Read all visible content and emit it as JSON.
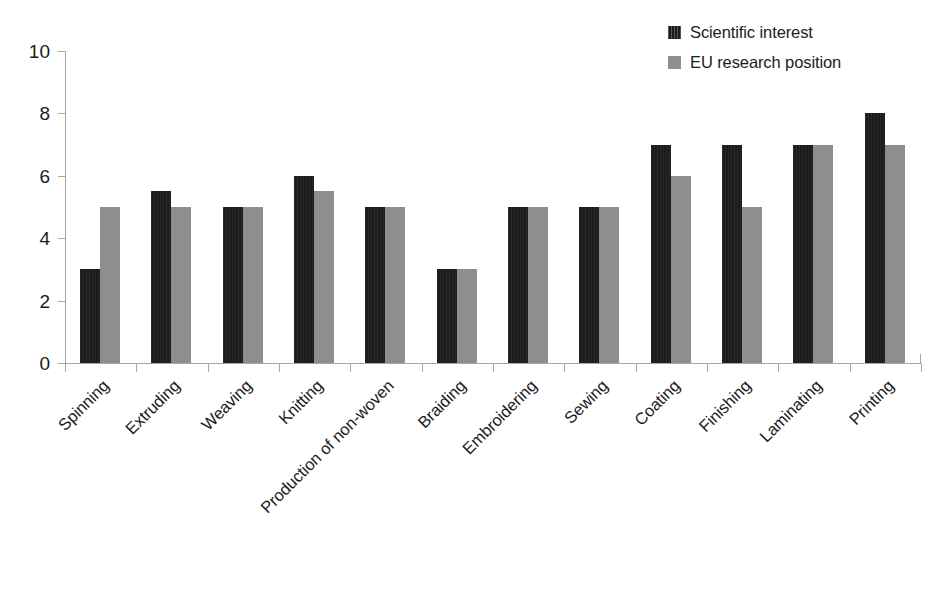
{
  "chart_data": {
    "type": "bar",
    "title": "",
    "subtitle": "",
    "xlabel": "",
    "ylabel": "",
    "ylim": [
      0,
      10
    ],
    "yticks": [
      0,
      2,
      4,
      6,
      8,
      10
    ],
    "ytick_labels": [
      "0",
      "2",
      "4",
      "6",
      "8",
      "10"
    ],
    "grid": false,
    "legend_position": "top-right",
    "categories": [
      "Spinning",
      "Extruding",
      "Weaving",
      "Knitting",
      "Production of non-woven",
      "Braiding",
      "Embroidering",
      "Sewing",
      "Coating",
      "Finishing",
      "Laminating",
      "Printing"
    ],
    "series": [
      {
        "name": "Scientific interest",
        "color": "#1c1c1c",
        "values": [
          3,
          5.5,
          5,
          6,
          5,
          3,
          5,
          5,
          7,
          7,
          7,
          8
        ]
      },
      {
        "name": "EU research position",
        "color": "#8e8e8e",
        "values": [
          5,
          5,
          5,
          5.5,
          5,
          3,
          5,
          5,
          6,
          5,
          7,
          7
        ]
      }
    ]
  },
  "legend": {
    "items": [
      {
        "label": "Scientific interest",
        "swatch": "legend-swatch-dark"
      },
      {
        "label": "EU research position",
        "swatch": "legend-swatch-gray"
      }
    ]
  }
}
